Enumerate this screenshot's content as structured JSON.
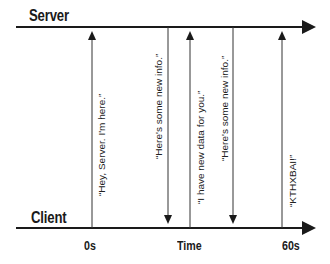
{
  "diagram": {
    "lanes": {
      "server": "Server",
      "client": "Client"
    },
    "axis": {
      "start": "0s",
      "middle": "Time",
      "end": "60s"
    },
    "messages": [
      {
        "text": "“Hey, Server. I'm here.”",
        "direction": "up"
      },
      {
        "text": "“Here's some new info.”",
        "direction": "down"
      },
      {
        "text": "“I have new data for you.”",
        "direction": "up"
      },
      {
        "text": "“Here's some new info.”",
        "direction": "down"
      },
      {
        "text": "“KTHXBAI!”",
        "direction": "up"
      }
    ],
    "colors": {
      "line": "#1a1a1a",
      "background": "#ffffff"
    }
  }
}
